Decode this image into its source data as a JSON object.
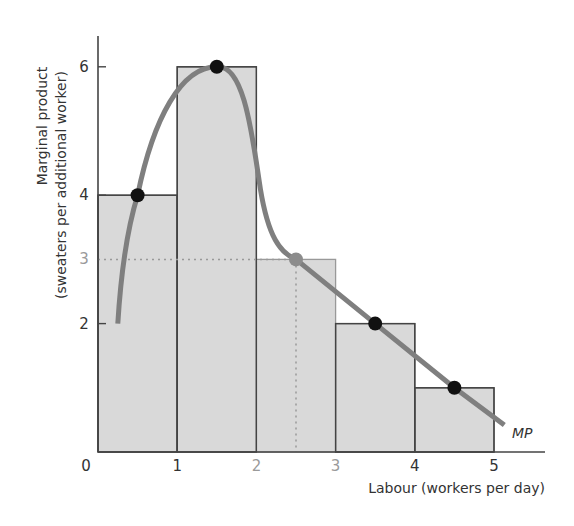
{
  "chart_data": {
    "type": "bar",
    "title": "",
    "xlabel": "Labour (workers per day)",
    "ylabel_line1": "Marginal product",
    "ylabel_line2": "(sweaters per additional worker)",
    "xlim": [
      0,
      5.6
    ],
    "ylim": [
      0,
      6.5
    ],
    "grid": false,
    "x_ticks": [
      "0",
      "1",
      "2",
      "3",
      "4",
      "5"
    ],
    "y_ticks": [
      "2",
      "3",
      "4",
      "6"
    ],
    "categories": [
      "0-1",
      "1-2",
      "2-3",
      "3-4",
      "4-5"
    ],
    "values": [
      4,
      6,
      3,
      2,
      1
    ],
    "bars": [
      {
        "x0": 0,
        "x1": 1,
        "value": 4,
        "highlight": false
      },
      {
        "x0": 1,
        "x1": 2,
        "value": 6,
        "highlight": false
      },
      {
        "x0": 2,
        "x1": 3,
        "value": 3,
        "highlight": true
      },
      {
        "x0": 3,
        "x1": 4,
        "value": 2,
        "highlight": false
      },
      {
        "x0": 4,
        "x1": 5,
        "value": 1,
        "highlight": false
      }
    ],
    "series": [
      {
        "name": "MP",
        "type": "line",
        "points": [
          {
            "x": 0.5,
            "y": 4
          },
          {
            "x": 1.5,
            "y": 6
          },
          {
            "x": 2.5,
            "y": 3
          },
          {
            "x": 3.5,
            "y": 2
          },
          {
            "x": 4.5,
            "y": 1
          }
        ],
        "curve_start": {
          "x": 0.25,
          "y": 2.0
        },
        "curve_end": {
          "x": 5.13,
          "y": 0.42
        }
      }
    ],
    "annotations": [
      {
        "type": "dotted-guide",
        "from": {
          "x": 0,
          "y": 3
        },
        "to": {
          "x": 2.5,
          "y": 3
        }
      },
      {
        "type": "dotted-guide",
        "from": {
          "x": 2.5,
          "y": 3
        },
        "to": {
          "x": 2.5,
          "y": 0
        }
      },
      {
        "type": "label",
        "text": "MP",
        "at": {
          "x": 5.3,
          "y": 0.3
        }
      }
    ],
    "colors": {
      "bar_fill": "#d9d9d9",
      "bar_stroke": "#444444",
      "highlight_bar_stroke": "#999999",
      "curve": "#7f7f7f",
      "point": "#111111",
      "highlight_point": "#8c8c8c",
      "axis": "#444444",
      "guide": "#999999"
    }
  }
}
